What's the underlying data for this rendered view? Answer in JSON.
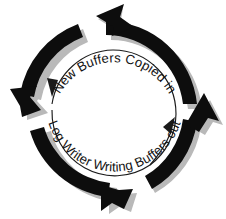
{
  "diagram": {
    "type": "circular-flow",
    "background_color": "#ffffff",
    "arrow_color": "#0d0d0d",
    "shadow_color": "#b9b9b9",
    "inner_circle_color": "#1a1a1a",
    "text_color": "#141414",
    "direction": "counterclockwise",
    "labels": {
      "top": "New Buffers Copied in",
      "bottom": "Log Writer Writing Buffers out"
    },
    "arrows": [
      {
        "name": "upper-left-arc",
        "points_to": "down-left",
        "tip": [
          22,
          115
        ]
      },
      {
        "name": "upper-right-arc",
        "points_to": "up-left",
        "tip": [
          98,
          12
        ]
      },
      {
        "name": "lower-left-arc",
        "points_to": "down-right",
        "tip": [
          132,
          200
        ]
      },
      {
        "name": "lower-right-arc",
        "points_to": "up-right",
        "tip": [
          205,
          95
        ]
      }
    ],
    "inner_arrows": [
      {
        "name": "inner-left-arrowhead",
        "points_to": "down"
      },
      {
        "name": "inner-right-arrowhead",
        "points_to": "up-right"
      }
    ]
  }
}
